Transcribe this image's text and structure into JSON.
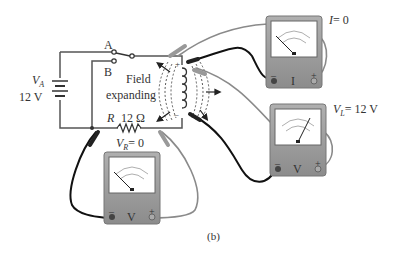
{
  "figure": {
    "caption": "(b)",
    "source": {
      "label_symbol": "V",
      "label_sub": "A",
      "value": "12  V"
    },
    "switch": {
      "pos_a": "A",
      "pos_b": "B"
    },
    "resistor": {
      "symbol": "R",
      "value": "12  Ω",
      "voltage_symbol": "V",
      "voltage_sub": "R",
      "voltage_value": "= 0"
    },
    "inductor": {
      "field_line1": "Field",
      "field_line2": "expanding",
      "plus": "+",
      "minus": "–"
    },
    "meters": {
      "ammeter": {
        "face_label": "I",
        "reading_symbol": "I",
        "reading_value": "= 0",
        "neg": "–",
        "pos": "+"
      },
      "inductor_voltmeter": {
        "face_label": "V",
        "reading_symbol": "V",
        "reading_sub": "L",
        "reading_value": "= 12  V",
        "neg": "–",
        "pos": "+"
      },
      "resistor_voltmeter": {
        "face_label": "V",
        "neg": "–",
        "pos": "+"
      }
    }
  },
  "colors": {
    "wire": "#555555",
    "meter_body": "#9a9a9a",
    "meter_face": "#ffffff",
    "lead_black": "#111111",
    "lead_gray": "#8a8a8a"
  }
}
